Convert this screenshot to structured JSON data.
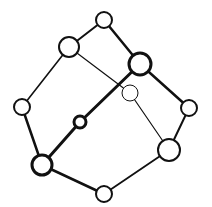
{
  "diagram": {
    "type": "graph",
    "colors": {
      "stroke": "#111111",
      "fill": "#ffffff",
      "background": "#ffffff"
    },
    "nodes": [
      {
        "id": "top",
        "x": 104,
        "y": 20,
        "r": 8,
        "sw": 2
      },
      {
        "id": "upper-left",
        "x": 69,
        "y": 47,
        "r": 10,
        "sw": 2
      },
      {
        "id": "upper-right",
        "x": 140,
        "y": 64,
        "r": 11,
        "sw": 3
      },
      {
        "id": "inner",
        "x": 130,
        "y": 93,
        "r": 8,
        "sw": 1
      },
      {
        "id": "left",
        "x": 22,
        "y": 107,
        "r": 8,
        "sw": 2
      },
      {
        "id": "right",
        "x": 189,
        "y": 108,
        "r": 8,
        "sw": 2
      },
      {
        "id": "center",
        "x": 80,
        "y": 122,
        "r": 6,
        "sw": 3
      },
      {
        "id": "lower-right",
        "x": 169,
        "y": 150,
        "r": 11,
        "sw": 2
      },
      {
        "id": "lower-left",
        "x": 42,
        "y": 165,
        "r": 10,
        "sw": 3
      },
      {
        "id": "bottom",
        "x": 104,
        "y": 194,
        "r": 8,
        "sw": 2
      }
    ],
    "edges": [
      {
        "from": "top",
        "to": "upper-left",
        "w": 2
      },
      {
        "from": "top",
        "to": "upper-right",
        "w": 2.5
      },
      {
        "from": "upper-left",
        "to": "left",
        "w": 1.6
      },
      {
        "from": "upper-left",
        "to": "inner",
        "w": 1.2
      },
      {
        "from": "upper-right",
        "to": "right",
        "w": 2.5
      },
      {
        "from": "upper-right",
        "to": "center",
        "w": 3
      },
      {
        "from": "inner",
        "to": "lower-right",
        "w": 1.2
      },
      {
        "from": "left",
        "to": "lower-left",
        "w": 2.5
      },
      {
        "from": "center",
        "to": "lower-left",
        "w": 3
      },
      {
        "from": "right",
        "to": "lower-right",
        "w": 2
      },
      {
        "from": "lower-left",
        "to": "bottom",
        "w": 2.5
      },
      {
        "from": "bottom",
        "to": "lower-right",
        "w": 1.8
      }
    ]
  }
}
